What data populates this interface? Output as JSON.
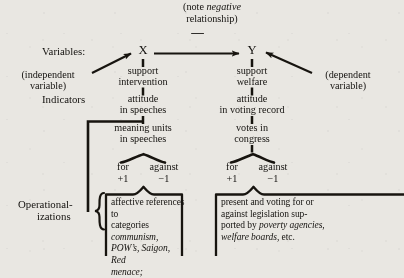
{
  "figure": {
    "note": {
      "line1_plain": "(note ",
      "line1_italic": "negative",
      "line2": "relationship)",
      "sign": "—"
    },
    "row_labels": {
      "variables": "Variables:",
      "indicators": "Indicators",
      "operationalizations_line1": "Operational-",
      "operationalizations_line2": "izations"
    },
    "variables": {
      "x": "X",
      "y": "Y",
      "independent_line1": "(independent",
      "independent_line2": "variable)",
      "dependent_line1": "(dependent",
      "dependent_line2": "variable)"
    },
    "left_column": {
      "concept_line1": "support",
      "concept_line2": "intervention",
      "indicator_line1": "attitude",
      "indicator_line2": "in speeches",
      "unit_line1": "meaning units",
      "unit_line2": "in speeches",
      "for_label": "for",
      "for_value": "+1",
      "against_label": "against",
      "against_value": "−1"
    },
    "right_column": {
      "concept_line1": "support",
      "concept_line2": "welfare",
      "indicator_line1": "attitude",
      "indicator_line2": "in voting record",
      "unit_line1": "votes in",
      "unit_line2": "congress",
      "for_label": "for",
      "for_value": "+1",
      "against_label": "against",
      "against_value": "−1"
    },
    "left_box": {
      "l1_a": "affective references to",
      "l2_a": "categories ",
      "l2_i": "communism,",
      "l3_i": "POW’s, Saigon, Red",
      "l4_i": "menace;"
    },
    "right_box": {
      "l1": "present and voting for or",
      "l2": "against legislation sup-",
      "l3_a": "ported by ",
      "l3_i": "poverty agencies,",
      "l4_i": "welfare boards",
      "l4_b": ", etc."
    }
  },
  "colors": {
    "background": "#e9e7e2",
    "ink": "#14120f",
    "rule": "#17140f"
  }
}
